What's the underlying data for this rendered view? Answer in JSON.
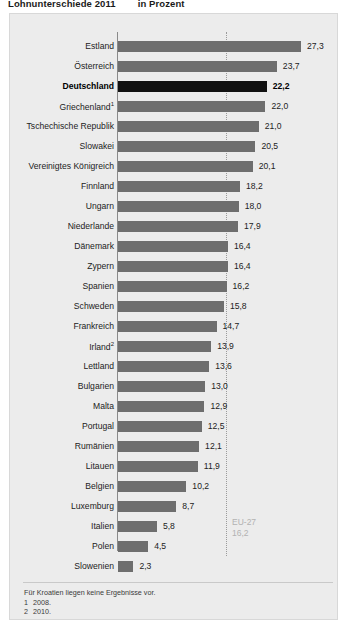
{
  "title": {
    "main": "Lohnunterschiede 2011",
    "sub": "in Prozent"
  },
  "reference": {
    "name": "EU-27",
    "value": "16,2"
  },
  "footnotes": {
    "note": "Für Kroatien liegen keine Ergebnisse vor.",
    "items": [
      {
        "num": "1",
        "text": "2008."
      },
      {
        "num": "2",
        "text": "2010."
      }
    ]
  },
  "chart_data": {
    "type": "bar",
    "orientation": "horizontal",
    "title": "Lohnunterschiede 2011",
    "xlabel": "in Prozent",
    "ylabel": "",
    "xlim": [
      0,
      27.3
    ],
    "grid": false,
    "legend": "none",
    "reference_line": {
      "label": "EU-27",
      "value": 16.2
    },
    "highlight": "Deutschland",
    "categories": [
      "Estland",
      "Österreich",
      "Deutschland",
      "Griechenland",
      "Tschechische Republik",
      "Slowakei",
      "Vereinigtes Königreich",
      "Finnland",
      "Ungarn",
      "Niederlande",
      "Dänemark",
      "Zypern",
      "Spanien",
      "Schweden",
      "Frankreich",
      "Irland",
      "Lettland",
      "Bulgarien",
      "Malta",
      "Portugal",
      "Rumänien",
      "Litauen",
      "Belgien",
      "Luxemburg",
      "Italien",
      "Polen",
      "Slowenien"
    ],
    "values": [
      27.3,
      23.7,
      22.2,
      22.0,
      21.0,
      20.5,
      20.1,
      18.2,
      18.0,
      17.9,
      16.4,
      16.4,
      16.2,
      15.8,
      14.7,
      13.9,
      13.6,
      13.0,
      12.9,
      12.5,
      12.1,
      11.9,
      10.2,
      8.7,
      5.8,
      4.5,
      2.3
    ],
    "rows": [
      {
        "label": "Estland",
        "footnote": "",
        "value": 27.3,
        "display": "27,3",
        "highlight": false
      },
      {
        "label": "Österreich",
        "footnote": "",
        "value": 23.7,
        "display": "23,7",
        "highlight": false
      },
      {
        "label": "Deutschland",
        "footnote": "",
        "value": 22.2,
        "display": "22,2",
        "highlight": true
      },
      {
        "label": "Griechenland",
        "footnote": "1",
        "value": 22.0,
        "display": "22,0",
        "highlight": false
      },
      {
        "label": "Tschechische Republik",
        "footnote": "",
        "value": 21.0,
        "display": "21,0",
        "highlight": false
      },
      {
        "label": "Slowakei",
        "footnote": "",
        "value": 20.5,
        "display": "20,5",
        "highlight": false
      },
      {
        "label": "Vereinigtes Königreich",
        "footnote": "",
        "value": 20.1,
        "display": "20,1",
        "highlight": false
      },
      {
        "label": "Finnland",
        "footnote": "",
        "value": 18.2,
        "display": "18,2",
        "highlight": false
      },
      {
        "label": "Ungarn",
        "footnote": "",
        "value": 18.0,
        "display": "18,0",
        "highlight": false
      },
      {
        "label": "Niederlande",
        "footnote": "",
        "value": 17.9,
        "display": "17,9",
        "highlight": false
      },
      {
        "label": "Dänemark",
        "footnote": "",
        "value": 16.4,
        "display": "16,4",
        "highlight": false
      },
      {
        "label": "Zypern",
        "footnote": "",
        "value": 16.4,
        "display": "16,4",
        "highlight": false
      },
      {
        "label": "Spanien",
        "footnote": "",
        "value": 16.2,
        "display": "16,2",
        "highlight": false
      },
      {
        "label": "Schweden",
        "footnote": "",
        "value": 15.8,
        "display": "15,8",
        "highlight": false
      },
      {
        "label": "Frankreich",
        "footnote": "",
        "value": 14.7,
        "display": "14,7",
        "highlight": false
      },
      {
        "label": "Irland",
        "footnote": "2",
        "value": 13.9,
        "display": "13,9",
        "highlight": false
      },
      {
        "label": "Lettland",
        "footnote": "",
        "value": 13.6,
        "display": "13,6",
        "highlight": false
      },
      {
        "label": "Bulgarien",
        "footnote": "",
        "value": 13.0,
        "display": "13,0",
        "highlight": false
      },
      {
        "label": "Malta",
        "footnote": "",
        "value": 12.9,
        "display": "12,9",
        "highlight": false
      },
      {
        "label": "Portugal",
        "footnote": "",
        "value": 12.5,
        "display": "12,5",
        "highlight": false
      },
      {
        "label": "Rumänien",
        "footnote": "",
        "value": 12.1,
        "display": "12,1",
        "highlight": false
      },
      {
        "label": "Litauen",
        "footnote": "",
        "value": 11.9,
        "display": "11,9",
        "highlight": false
      },
      {
        "label": "Belgien",
        "footnote": "",
        "value": 10.2,
        "display": "10,2",
        "highlight": false
      },
      {
        "label": "Luxemburg",
        "footnote": "",
        "value": 8.7,
        "display": "8,7",
        "highlight": false
      },
      {
        "label": "Italien",
        "footnote": "",
        "value": 5.8,
        "display": "5,8",
        "highlight": false
      },
      {
        "label": "Polen",
        "footnote": "",
        "value": 4.5,
        "display": "4,5",
        "highlight": false
      },
      {
        "label": "Slowenien",
        "footnote": "",
        "value": 2.3,
        "display": "2,3",
        "highlight": false
      }
    ]
  }
}
